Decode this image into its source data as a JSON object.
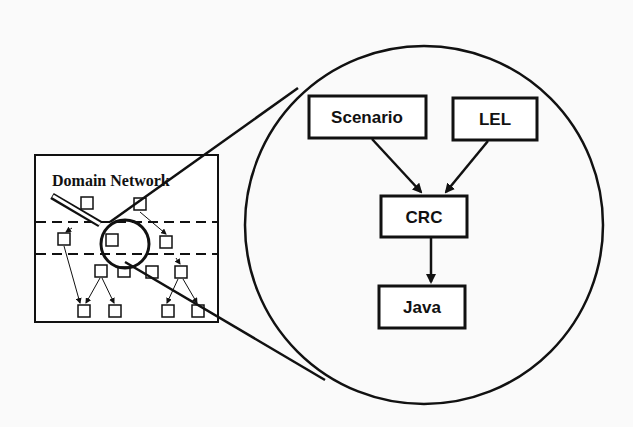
{
  "diagram": {
    "overview": {
      "title": "Domain Network"
    },
    "zoom": {
      "nodes": [
        {
          "id": "scenario",
          "label": "Scenario"
        },
        {
          "id": "lel",
          "label": "LEL"
        },
        {
          "id": "crc",
          "label": "CRC"
        },
        {
          "id": "java",
          "label": "Java"
        }
      ],
      "edges": [
        {
          "from": "scenario",
          "to": "crc"
        },
        {
          "from": "lel",
          "to": "crc"
        },
        {
          "from": "crc",
          "to": "java"
        }
      ]
    },
    "colors": {
      "ink": "#111111",
      "background": "#fafafa"
    }
  }
}
